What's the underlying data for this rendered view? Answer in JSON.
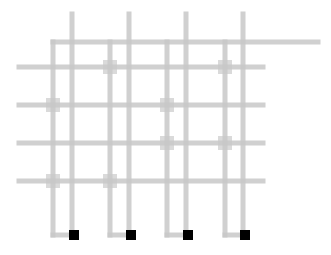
{
  "diagram": {
    "width": 331,
    "height": 255,
    "colors": {
      "background": "#ffffff",
      "line": "#c8c8c8",
      "marker": "#d6d6d6",
      "terminal": "#000000"
    },
    "line_width": 5,
    "top_bus": {
      "x1": 53,
      "y": 42,
      "x2": 318
    },
    "rows": [
      {
        "y": 67,
        "x1": 19,
        "x2": 263
      },
      {
        "y": 105,
        "x1": 19,
        "x2": 263
      },
      {
        "y": 143,
        "x1": 19,
        "x2": 263
      },
      {
        "y": 181,
        "x1": 19,
        "x2": 263
      }
    ],
    "columns": [
      {
        "l_x": 53,
        "straight_x": 72,
        "terminal_y": 235
      },
      {
        "l_x": 110,
        "straight_x": 129,
        "terminal_y": 235
      },
      {
        "l_x": 167,
        "straight_x": 186,
        "terminal_y": 235
      },
      {
        "l_x": 225,
        "straight_x": 243,
        "terminal_y": 235
      }
    ],
    "straight_top_y": 14,
    "terminal_size": 10,
    "markers": [
      {
        "row": 0,
        "col": 1
      },
      {
        "row": 0,
        "col": 3
      },
      {
        "row": 1,
        "col": 0
      },
      {
        "row": 1,
        "col": 2
      },
      {
        "row": 2,
        "col": 2
      },
      {
        "row": 2,
        "col": 3
      },
      {
        "row": 3,
        "col": 0
      },
      {
        "row": 3,
        "col": 1
      }
    ],
    "marker_size": 14
  }
}
